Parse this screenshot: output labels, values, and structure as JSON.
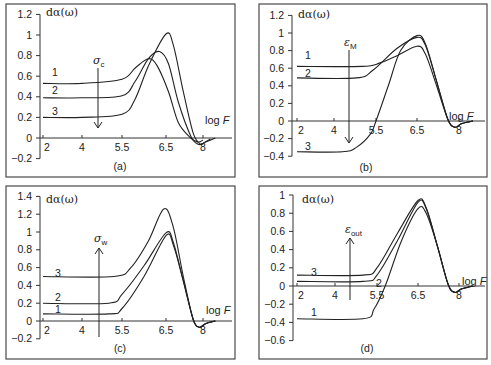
{
  "chart_data": [
    {
      "id": "a",
      "type": "line",
      "panel_label": "(a)",
      "ylabel": "dα(ω)",
      "xlabel": "log F",
      "x_ticks": [
        "2",
        "4",
        "5.5",
        "6.5",
        "8"
      ],
      "y_ticks": [
        "1.2",
        "1",
        "0.8",
        "0.6",
        "0.4",
        "0.2",
        "0",
        "−0.2"
      ],
      "ylim": [
        -0.2,
        1.2
      ],
      "parameter": {
        "symbol": "σ",
        "sub": "c",
        "direction": "down"
      },
      "series": [
        {
          "name": "1",
          "points": [
            [
              2,
              0.53
            ],
            [
              4,
              0.53
            ],
            [
              5.5,
              0.57
            ],
            [
              5.8,
              0.68
            ],
            [
              6.1,
              0.77
            ],
            [
              6.3,
              0.7
            ],
            [
              6.6,
              0.45
            ],
            [
              7.0,
              0.15
            ],
            [
              7.5,
              0.0
            ],
            [
              7.8,
              -0.04
            ],
            [
              8.0,
              -0.02
            ]
          ]
        },
        {
          "name": "2",
          "points": [
            [
              2,
              0.39
            ],
            [
              4,
              0.39
            ],
            [
              5.5,
              0.41
            ],
            [
              5.8,
              0.55
            ],
            [
              6.1,
              0.77
            ],
            [
              6.35,
              0.84
            ],
            [
              6.6,
              0.72
            ],
            [
              7.0,
              0.35
            ],
            [
              7.5,
              0.02
            ],
            [
              7.8,
              -0.06
            ],
            [
              8.0,
              -0.05
            ],
            [
              8.3,
              -0.01
            ]
          ]
        },
        {
          "name": "3",
          "points": [
            [
              2,
              0.2
            ],
            [
              4,
              0.2
            ],
            [
              5.5,
              0.23
            ],
            [
              5.8,
              0.38
            ],
            [
              6.1,
              0.7
            ],
            [
              6.5,
              1.01
            ],
            [
              6.8,
              0.9
            ],
            [
              7.2,
              0.45
            ],
            [
              7.6,
              0.05
            ],
            [
              7.9,
              -0.06
            ],
            [
              8.1,
              -0.04
            ],
            [
              8.5,
              0.0
            ]
          ]
        }
      ]
    },
    {
      "id": "b",
      "type": "line",
      "panel_label": "(b)",
      "ylabel": "dα(ω)",
      "xlabel": "log F",
      "x_ticks": [
        "2",
        "4",
        "5.5",
        "6.5",
        "8"
      ],
      "y_ticks": [
        "1.2",
        "1",
        "0.8",
        "0.6",
        "0.4",
        "0.2",
        "0",
        "−0.2",
        "−0.4"
      ],
      "ylim": [
        -0.4,
        1.2
      ],
      "parameter": {
        "symbol": "ε",
        "sub": "M",
        "direction": "down"
      },
      "series": [
        {
          "name": "1",
          "points": [
            [
              2,
              0.62
            ],
            [
              5.0,
              0.62
            ],
            [
              5.6,
              0.66
            ],
            [
              6.0,
              0.74
            ],
            [
              6.5,
              0.85
            ],
            [
              6.8,
              0.76
            ],
            [
              7.2,
              0.4
            ],
            [
              7.6,
              0.02
            ],
            [
              7.85,
              -0.07
            ],
            [
              8.1,
              -0.03
            ],
            [
              8.5,
              0.0
            ]
          ]
        },
        {
          "name": "2",
          "points": [
            [
              2,
              0.49
            ],
            [
              4.8,
              0.49
            ],
            [
              5.4,
              0.58
            ],
            [
              6.0,
              0.82
            ],
            [
              6.5,
              0.95
            ],
            [
              6.8,
              0.86
            ],
            [
              7.2,
              0.45
            ],
            [
              7.6,
              0.02
            ],
            [
              7.85,
              -0.07
            ],
            [
              8.1,
              -0.03
            ],
            [
              8.5,
              0.0
            ]
          ]
        },
        {
          "name": "3",
          "points": [
            [
              2,
              -0.35
            ],
            [
              4.3,
              -0.35
            ],
            [
              4.8,
              -0.3
            ],
            [
              5.3,
              -0.15
            ],
            [
              5.5,
              0.0
            ],
            [
              5.8,
              0.4
            ],
            [
              6.1,
              0.8
            ],
            [
              6.5,
              0.97
            ],
            [
              6.8,
              0.88
            ],
            [
              7.2,
              0.45
            ],
            [
              7.6,
              0.02
            ],
            [
              7.85,
              -0.07
            ],
            [
              8.1,
              -0.03
            ],
            [
              8.5,
              0.0
            ]
          ]
        }
      ]
    },
    {
      "id": "c",
      "type": "line",
      "panel_label": "(c)",
      "ylabel": "dα(ω)",
      "xlabel": "log F",
      "x_ticks": [
        "2",
        "4",
        "5.5",
        "6.5",
        "8"
      ],
      "y_ticks": [
        "1.4",
        "1.2",
        "1",
        "0.8",
        "0.6",
        "0.4",
        "0.2",
        "0",
        "−0.2"
      ],
      "ylim": [
        -0.2,
        1.4
      ],
      "parameter": {
        "symbol": "σ",
        "sub": "w",
        "direction": "up"
      },
      "series": [
        {
          "name": "1",
          "points": [
            [
              2,
              0.08
            ],
            [
              5.0,
              0.08
            ],
            [
              5.5,
              0.14
            ],
            [
              6.0,
              0.5
            ],
            [
              6.5,
              0.96
            ],
            [
              6.8,
              0.85
            ],
            [
              7.2,
              0.45
            ],
            [
              7.6,
              0.02
            ],
            [
              7.85,
              -0.07
            ],
            [
              8.1,
              -0.03
            ],
            [
              8.5,
              0.0
            ]
          ]
        },
        {
          "name": "2",
          "points": [
            [
              2,
              0.2
            ],
            [
              5.0,
              0.2
            ],
            [
              5.5,
              0.3
            ],
            [
              6.0,
              0.62
            ],
            [
              6.5,
              0.99
            ],
            [
              6.8,
              0.88
            ],
            [
              7.2,
              0.45
            ],
            [
              7.6,
              0.02
            ],
            [
              7.85,
              -0.07
            ],
            [
              8.1,
              -0.03
            ],
            [
              8.5,
              0.0
            ]
          ]
        },
        {
          "name": "3",
          "points": [
            [
              2,
              0.5
            ],
            [
              5.2,
              0.5
            ],
            [
              5.7,
              0.6
            ],
            [
              6.1,
              0.9
            ],
            [
              6.45,
              1.26
            ],
            [
              6.8,
              1.05
            ],
            [
              7.2,
              0.5
            ],
            [
              7.6,
              0.02
            ],
            [
              7.85,
              -0.07
            ],
            [
              8.1,
              -0.03
            ],
            [
              8.5,
              0.0
            ]
          ]
        }
      ]
    },
    {
      "id": "d",
      "type": "line",
      "panel_label": "(d)",
      "ylabel": "dα(ω)",
      "xlabel": "log F",
      "x_ticks": [
        "2",
        "4",
        "5.5",
        "6.5",
        "8"
      ],
      "y_ticks": [
        "1",
        "0.8",
        "0.6",
        "0.4",
        "0.2",
        "0",
        "−0.2",
        "−0.4",
        "−0.6"
      ],
      "ylim": [
        -0.6,
        1.0
      ],
      "parameter": {
        "symbol": "ε",
        "sub": "out",
        "direction": "up"
      },
      "series": [
        {
          "name": "1",
          "points": [
            [
              2,
              -0.36
            ],
            [
              5.0,
              -0.36
            ],
            [
              5.4,
              -0.25
            ],
            [
              5.7,
              0.0
            ],
            [
              6.1,
              0.5
            ],
            [
              6.5,
              0.85
            ],
            [
              6.8,
              0.8
            ],
            [
              7.2,
              0.45
            ],
            [
              7.6,
              0.02
            ],
            [
              7.85,
              -0.07
            ],
            [
              8.1,
              -0.03
            ],
            [
              8.5,
              0.0
            ]
          ]
        },
        {
          "name": "2",
          "points": [
            [
              2,
              0.05
            ],
            [
              5.0,
              0.05
            ],
            [
              5.5,
              0.12
            ],
            [
              6.0,
              0.5
            ],
            [
              6.5,
              0.92
            ],
            [
              6.8,
              0.85
            ],
            [
              7.2,
              0.45
            ],
            [
              7.6,
              0.02
            ],
            [
              7.85,
              -0.07
            ],
            [
              8.1,
              -0.03
            ],
            [
              8.5,
              0.0
            ]
          ]
        },
        {
          "name": "3",
          "points": [
            [
              2,
              0.12
            ],
            [
              5.0,
              0.12
            ],
            [
              5.5,
              0.2
            ],
            [
              6.0,
              0.58
            ],
            [
              6.5,
              0.94
            ],
            [
              6.8,
              0.86
            ],
            [
              7.2,
              0.45
            ],
            [
              7.6,
              0.02
            ],
            [
              7.85,
              -0.07
            ],
            [
              8.1,
              -0.03
            ],
            [
              8.5,
              0.0
            ]
          ]
        }
      ]
    }
  ]
}
